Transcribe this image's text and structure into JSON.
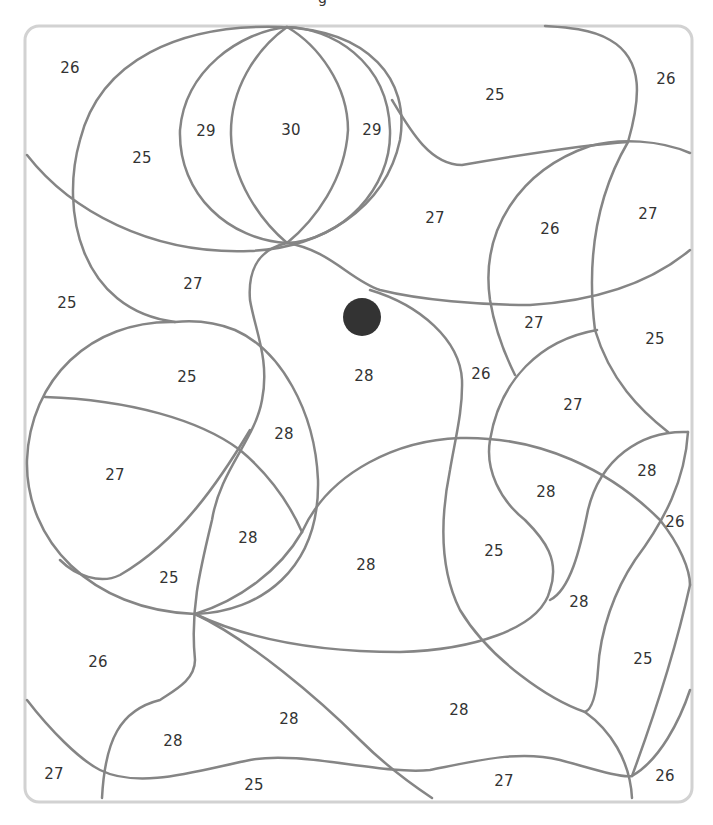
{
  "page": {
    "title_fragment": "g",
    "frame_color": "#d2d2d2",
    "line_color": "#858585",
    "text_color": "#333333"
  },
  "marker": {
    "x": 362,
    "y": 317,
    "r": 19,
    "color": "#333333"
  },
  "regions": [
    {
      "label": "26",
      "x": 70,
      "y": 68
    },
    {
      "label": "29",
      "x": 206,
      "y": 131
    },
    {
      "label": "30",
      "x": 291,
      "y": 130
    },
    {
      "label": "29",
      "x": 372,
      "y": 130
    },
    {
      "label": "25",
      "x": 142,
      "y": 158
    },
    {
      "label": "25",
      "x": 495,
      "y": 95
    },
    {
      "label": "26",
      "x": 666,
      "y": 79
    },
    {
      "label": "27",
      "x": 435,
      "y": 218
    },
    {
      "label": "26",
      "x": 550,
      "y": 229
    },
    {
      "label": "27",
      "x": 648,
      "y": 214
    },
    {
      "label": "27",
      "x": 193,
      "y": 284
    },
    {
      "label": "25",
      "x": 67,
      "y": 303
    },
    {
      "label": "27",
      "x": 534,
      "y": 323
    },
    {
      "label": "25",
      "x": 655,
      "y": 339
    },
    {
      "label": "25",
      "x": 187,
      "y": 377
    },
    {
      "label": "28",
      "x": 364,
      "y": 376
    },
    {
      "label": "26",
      "x": 481,
      "y": 374
    },
    {
      "label": "27",
      "x": 573,
      "y": 405
    },
    {
      "label": "28",
      "x": 284,
      "y": 434
    },
    {
      "label": "27",
      "x": 115,
      "y": 475
    },
    {
      "label": "28",
      "x": 647,
      "y": 471
    },
    {
      "label": "28",
      "x": 546,
      "y": 492
    },
    {
      "label": "26",
      "x": 675,
      "y": 522
    },
    {
      "label": "28",
      "x": 248,
      "y": 538
    },
    {
      "label": "28",
      "x": 366,
      "y": 565
    },
    {
      "label": "25",
      "x": 494,
      "y": 551
    },
    {
      "label": "25",
      "x": 169,
      "y": 578
    },
    {
      "label": "28",
      "x": 579,
      "y": 602
    },
    {
      "label": "26",
      "x": 98,
      "y": 662
    },
    {
      "label": "25",
      "x": 643,
      "y": 659
    },
    {
      "label": "28",
      "x": 289,
      "y": 719
    },
    {
      "label": "28",
      "x": 459,
      "y": 710
    },
    {
      "label": "28",
      "x": 173,
      "y": 741
    },
    {
      "label": "27",
      "x": 54,
      "y": 774
    },
    {
      "label": "25",
      "x": 254,
      "y": 785
    },
    {
      "label": "27",
      "x": 504,
      "y": 781
    },
    {
      "label": "26",
      "x": 665,
      "y": 776
    }
  ]
}
